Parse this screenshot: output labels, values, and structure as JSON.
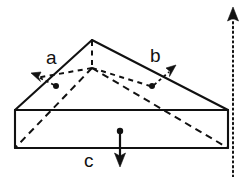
{
  "figure": {
    "shape": "triangular prism (wedge)",
    "background_color": "#ffffff",
    "line_color": "#111111"
  },
  "labels": {
    "a": "a",
    "b": "b",
    "c": "c"
  },
  "icons": {
    "arrow_a": "arrow-upleft-icon",
    "arrow_b": "arrow-upright-icon",
    "arrow_c": "arrow-down-icon",
    "reference_axis": "arrow-up-dotted-icon"
  },
  "geometry": {
    "front_apex": [
      92,
      40
    ],
    "front_left": [
      15,
      110
    ],
    "front_right": [
      228,
      110
    ],
    "base_bottom_left": [
      15,
      148
    ],
    "base_bottom_right": [
      228,
      148
    ],
    "back_apex": [
      92,
      68
    ],
    "back_left": [
      15,
      68
    ],
    "back_bottom_left": [
      15,
      148
    ],
    "reference_line_x": 233,
    "reference_line_top_y": 10,
    "reference_line_bottom_y": 177
  },
  "vectors": [
    {
      "name": "a",
      "label": "a",
      "origin": [
        56,
        86
      ],
      "tip": [
        33,
        75
      ],
      "direction": "up-left",
      "style": "dashed-shaft"
    },
    {
      "name": "b",
      "label": "b",
      "origin": [
        152,
        86
      ],
      "tip": [
        174,
        68
      ],
      "direction": "up-right",
      "style": "dashed-shaft"
    },
    {
      "name": "c",
      "label": "c",
      "origin": [
        120,
        131
      ],
      "tip": [
        120,
        165
      ],
      "direction": "down",
      "style": "solid-shaft"
    }
  ],
  "line_styles": {
    "visible_edges": "solid",
    "hidden_edges": "dashed",
    "reference_axis": "dotted"
  }
}
